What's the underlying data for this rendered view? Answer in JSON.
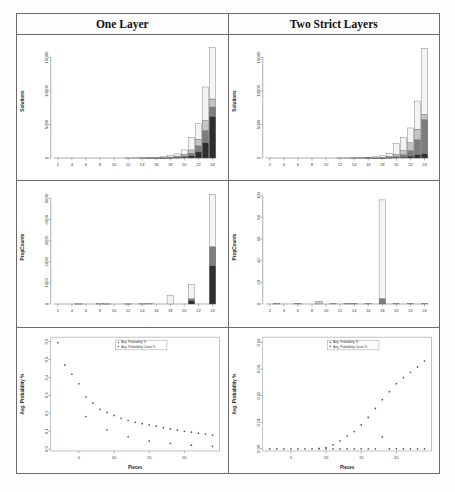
{
  "figure": {
    "columns": [
      {
        "id": "one-layer",
        "title": "One Layer"
      },
      {
        "id": "two-strict-layers",
        "title": "Two Strict Layers"
      }
    ],
    "legend_entries": [
      "Avg. Probability %",
      "Avg. Probability Count %"
    ],
    "colors": {
      "stack_bottom": "#2e2e2e",
      "stack_mid": "#7d7d7d",
      "stack_upper": "#c4c4c4",
      "stack_top": "#f4f4f4",
      "axis": "#8a8a8a",
      "border": "#6b6b6b",
      "point": "#555555"
    }
  },
  "chart_data": [
    {
      "id": "solutions-one-layer",
      "type": "bar",
      "stacked": true,
      "title": "",
      "xlabel": "",
      "ylabel": "Solutions",
      "xlim": [
        1,
        25
      ],
      "ylim": [
        0,
        17000
      ],
      "xticks": [
        2,
        4,
        6,
        8,
        10,
        12,
        14,
        16,
        18,
        20,
        22,
        24
      ],
      "yticks": [
        0,
        5000,
        10000,
        15000
      ],
      "ytick_labels": [
        "0",
        "5000",
        "10000",
        "15000"
      ],
      "categories": [
        1,
        2,
        3,
        4,
        5,
        6,
        7,
        8,
        9,
        10,
        11,
        12,
        13,
        14,
        15,
        16,
        17,
        18,
        19,
        20,
        21,
        22,
        23,
        24
      ],
      "series": [
        {
          "name": "segment-bottom",
          "color": "#2e2e2e",
          "values": [
            0,
            0,
            0,
            0,
            0,
            0,
            0,
            0,
            0,
            0,
            0,
            0,
            0,
            0,
            0,
            5,
            10,
            25,
            50,
            110,
            300,
            900,
            2300,
            6200
          ]
        },
        {
          "name": "segment-mid",
          "color": "#7d7d7d",
          "values": [
            0,
            0,
            0,
            0,
            0,
            0,
            0,
            0,
            0,
            0,
            0,
            0,
            0,
            0,
            5,
            10,
            20,
            40,
            80,
            180,
            400,
            900,
            1800,
            1400
          ]
        },
        {
          "name": "segment-upper",
          "color": "#c4c4c4",
          "values": [
            0,
            0,
            0,
            0,
            0,
            0,
            0,
            0,
            0,
            0,
            0,
            0,
            0,
            5,
            10,
            20,
            35,
            70,
            130,
            260,
            500,
            1000,
            1500,
            1200
          ]
        },
        {
          "name": "segment-top",
          "color": "#f4f4f4",
          "values": [
            0,
            0,
            0,
            0,
            0,
            0,
            0,
            0,
            0,
            0,
            0,
            5,
            10,
            20,
            35,
            65,
            110,
            215,
            340,
            650,
            1900,
            2300,
            5000,
            7700
          ]
        }
      ]
    },
    {
      "id": "solutions-two-strict-layers",
      "type": "bar",
      "stacked": true,
      "title": "",
      "xlabel": "",
      "ylabel": "Solutions",
      "xlim": [
        1,
        25
      ],
      "ylim": [
        0,
        17000
      ],
      "xticks": [
        2,
        4,
        6,
        8,
        10,
        12,
        14,
        16,
        18,
        20,
        22,
        24
      ],
      "yticks": [
        0,
        5000,
        10000,
        15000
      ],
      "ytick_labels": [
        "0",
        "5000",
        "10000",
        "15000"
      ],
      "categories": [
        1,
        2,
        3,
        4,
        5,
        6,
        7,
        8,
        9,
        10,
        11,
        12,
        13,
        14,
        15,
        16,
        17,
        18,
        19,
        20,
        21,
        22,
        23,
        24
      ],
      "series": [
        {
          "name": "segment-bottom",
          "color": "#2e2e2e",
          "values": [
            0,
            0,
            0,
            0,
            0,
            0,
            0,
            0,
            0,
            0,
            0,
            0,
            0,
            0,
            0,
            0,
            5,
            10,
            25,
            60,
            120,
            280,
            500,
            600
          ]
        },
        {
          "name": "segment-mid",
          "color": "#7d7d7d",
          "values": [
            0,
            0,
            0,
            0,
            0,
            0,
            0,
            0,
            0,
            0,
            0,
            0,
            0,
            0,
            0,
            5,
            12,
            30,
            70,
            160,
            350,
            800,
            2200,
            5100
          ]
        },
        {
          "name": "segment-upper",
          "color": "#c4c4c4",
          "values": [
            0,
            0,
            0,
            0,
            0,
            0,
            0,
            0,
            0,
            0,
            0,
            0,
            0,
            5,
            10,
            20,
            35,
            70,
            150,
            320,
            650,
            1200,
            1600,
            800
          ]
        },
        {
          "name": "segment-top",
          "color": "#f4f4f4",
          "values": [
            0,
            0,
            0,
            0,
            0,
            0,
            0,
            0,
            0,
            0,
            0,
            5,
            10,
            20,
            35,
            60,
            110,
            210,
            450,
            1600,
            1900,
            2200,
            4200,
            9900
          ]
        }
      ]
    },
    {
      "id": "propcounts-one-layer",
      "type": "bar",
      "stacked": true,
      "title": "",
      "xlabel": "",
      "ylabel": "PropCounts",
      "xlim": [
        1,
        25
      ],
      "ylim": [
        0,
        5400
      ],
      "xticks": [
        2,
        4,
        6,
        8,
        10,
        12,
        14,
        16,
        18,
        20,
        22,
        24
      ],
      "yticks": [
        0,
        1000,
        2000,
        3000,
        4000,
        5000
      ],
      "ytick_labels": [
        "0",
        "1000",
        "2000",
        "3000",
        "4000",
        "5000"
      ],
      "categories": [
        1,
        2,
        3,
        4,
        5,
        6,
        7,
        8,
        9,
        10,
        11,
        12,
        13,
        14,
        15,
        16,
        17,
        18,
        19,
        20,
        21,
        22,
        23,
        24
      ],
      "series": [
        {
          "name": "segment-bottom",
          "color": "#2e2e2e",
          "values": [
            0,
            0,
            0,
            0,
            0,
            0,
            0,
            0,
            0,
            0,
            0,
            0,
            0,
            0,
            0,
            0,
            0,
            0,
            0,
            0,
            160,
            0,
            0,
            1820
          ]
        },
        {
          "name": "segment-mid",
          "color": "#7d7d7d",
          "values": [
            0,
            0,
            0,
            0,
            0,
            0,
            0,
            0,
            0,
            0,
            0,
            0,
            0,
            0,
            0,
            0,
            0,
            0,
            0,
            0,
            90,
            0,
            0,
            900
          ]
        },
        {
          "name": "segment-upper",
          "color": "#c4c4c4",
          "values": [
            0,
            0,
            0,
            0,
            10,
            0,
            0,
            15,
            10,
            0,
            0,
            10,
            0,
            15,
            20,
            0,
            0,
            0,
            0,
            0,
            0,
            0,
            0,
            0
          ]
        },
        {
          "name": "segment-top",
          "color": "#f4f4f4",
          "values": [
            0,
            0,
            0,
            0,
            0,
            0,
            0,
            0,
            0,
            0,
            0,
            0,
            0,
            0,
            0,
            0,
            0,
            400,
            0,
            0,
            680,
            0,
            0,
            2480
          ]
        }
      ]
    },
    {
      "id": "propcounts-two-strict-layers",
      "type": "bar",
      "stacked": true,
      "title": "",
      "xlabel": "",
      "ylabel": "PropCounts",
      "xlim": [
        1,
        25
      ],
      "ylim": [
        0,
        105
      ],
      "xticks": [
        2,
        4,
        6,
        8,
        10,
        12,
        14,
        16,
        18,
        20,
        22,
        24
      ],
      "yticks": [
        0,
        20,
        40,
        60,
        80,
        100
      ],
      "ytick_labels": [
        "0",
        "20",
        "40",
        "60",
        "80",
        "100"
      ],
      "categories": [
        1,
        2,
        3,
        4,
        5,
        6,
        7,
        8,
        9,
        10,
        11,
        12,
        13,
        14,
        15,
        16,
        17,
        18,
        19,
        20,
        21,
        22,
        23,
        24
      ],
      "series": [
        {
          "name": "segment-bottom",
          "color": "#2e2e2e",
          "values": [
            0,
            0,
            0,
            0,
            0,
            0,
            0,
            0,
            0,
            0,
            0,
            0,
            0,
            0,
            0,
            0,
            0,
            0,
            0,
            0,
            0,
            0,
            0,
            0
          ]
        },
        {
          "name": "segment-mid",
          "color": "#7d7d7d",
          "values": [
            0,
            0,
            0,
            0,
            0,
            0,
            0,
            0,
            0,
            0,
            0,
            0,
            0,
            0,
            0,
            0,
            0,
            5,
            0,
            0,
            0,
            0,
            0,
            0
          ]
        },
        {
          "name": "segment-upper",
          "color": "#c4c4c4",
          "values": [
            0,
            0,
            0.6,
            0,
            0,
            0.6,
            0,
            0,
            2.2,
            0,
            0.6,
            0,
            0.6,
            0.6,
            0,
            0.6,
            0,
            0,
            0,
            0.6,
            0,
            0.6,
            0,
            0.6
          ]
        },
        {
          "name": "segment-top",
          "color": "#f4f4f4",
          "values": [
            0,
            0,
            0,
            0,
            0,
            0,
            0,
            0,
            0,
            0,
            0,
            0,
            0,
            0,
            0,
            0,
            0,
            91,
            0,
            0,
            0,
            0,
            0,
            0
          ]
        }
      ]
    },
    {
      "id": "probability-one-layer",
      "type": "scatter",
      "title": "",
      "xlabel": "Pieces",
      "ylabel": "Avg. Probability %",
      "xlim": [
        1,
        25
      ],
      "ylim": [
        -0.01,
        0.625
      ],
      "xticks": [
        5,
        10,
        15,
        20
      ],
      "yticks": [
        0.0,
        0.1,
        0.2,
        0.3,
        0.4,
        0.5,
        0.6
      ],
      "ytick_labels": [
        "0.0",
        "0.1",
        "0.2",
        "0.3",
        "0.4",
        "0.5",
        "0.6"
      ],
      "legend_position": "top-center",
      "series": [
        {
          "name": "Avg. Probability %",
          "x": [
            2,
            3,
            4,
            5,
            6,
            7,
            8,
            9,
            10,
            11,
            12,
            13,
            14,
            15,
            16,
            17,
            18,
            19,
            20,
            21,
            22,
            23,
            24
          ],
          "y": [
            0.595,
            0.47,
            0.418,
            0.365,
            0.292,
            0.258,
            0.222,
            0.205,
            0.188,
            0.172,
            0.16,
            0.15,
            0.142,
            0.136,
            0.128,
            0.12,
            0.113,
            0.106,
            0.1,
            0.095,
            0.089,
            0.084,
            0.079
          ]
        },
        {
          "name": "Avg. Probability Count %",
          "x": [
            6,
            9,
            12,
            15,
            18,
            21,
            24
          ],
          "y": [
            0.182,
            0.108,
            0.07,
            0.045,
            0.033,
            0.022,
            0.016
          ]
        }
      ]
    },
    {
      "id": "probability-two-strict-layers",
      "type": "scatter",
      "title": "",
      "xlabel": "Pieces",
      "ylabel": "Avg. Probability %",
      "xlim": [
        1,
        25
      ],
      "ylim": [
        -0.0008,
        0.042
      ],
      "xticks": [
        5,
        10,
        15,
        20
      ],
      "yticks": [
        0.0,
        0.01,
        0.02,
        0.03,
        0.04
      ],
      "ytick_labels": [
        "0.00",
        "0.01",
        "0.02",
        "0.03",
        "0.04"
      ],
      "legend_position": "top-center",
      "series": [
        {
          "name": "Avg. Probability %",
          "x": [
            2,
            3,
            4,
            5,
            6,
            7,
            8,
            9,
            10,
            11,
            12,
            13,
            14,
            15,
            16,
            17,
            18,
            19,
            20,
            21,
            22,
            23,
            24
          ],
          "y": [
            0.0,
            0.0,
            0.0,
            0.0,
            0.0,
            0.0,
            0.0,
            0.0002,
            0.0005,
            0.0015,
            0.003,
            0.0048,
            0.0065,
            0.009,
            0.0118,
            0.0152,
            0.0185,
            0.0215,
            0.0245,
            0.0268,
            0.0288,
            0.0308,
            0.033
          ]
        },
        {
          "name": "Avg. Probability Count %",
          "x": [
            9,
            10,
            11,
            12,
            13,
            14,
            15,
            16,
            17,
            18,
            19,
            20,
            21,
            22,
            23,
            24
          ],
          "y": [
            0.0,
            0.0,
            0.0,
            0.0,
            0.0,
            0.0,
            0.0,
            0.0,
            0.0,
            0.0045,
            0.0,
            0.0,
            0.0,
            0.0,
            0.0,
            0.0
          ]
        }
      ]
    }
  ]
}
